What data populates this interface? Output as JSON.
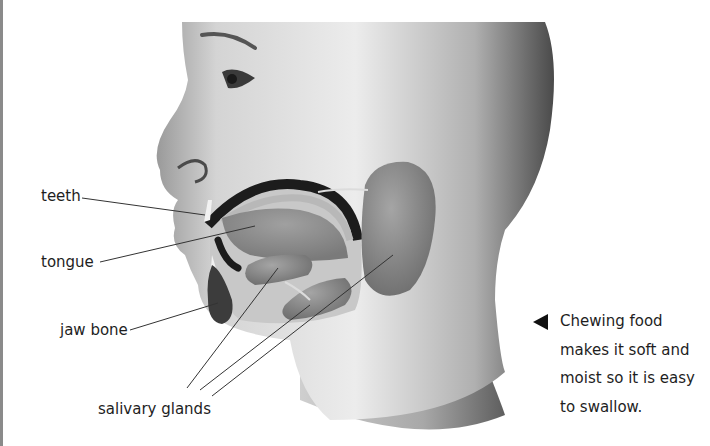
{
  "figure": {
    "labels": [
      {
        "id": "teeth",
        "text": "teeth"
      },
      {
        "id": "tongue",
        "text": "tongue"
      },
      {
        "id": "jaw-bone",
        "text": "jaw bone"
      },
      {
        "id": "salivary-glands",
        "text": "salivary glands"
      }
    ],
    "caption": {
      "arrow_icon": "left-pointing-triangle",
      "lines": [
        "Chewing food",
        "makes it soft and",
        "moist so it is easy",
        "to swallow."
      ]
    }
  },
  "colors": {
    "skin_light": "#e6e6e6",
    "skin_dark": "#5a5a5a",
    "gland": "#8c8c8c",
    "mouth_dark": "#1c1c1c",
    "text": "#1e1e1e"
  }
}
